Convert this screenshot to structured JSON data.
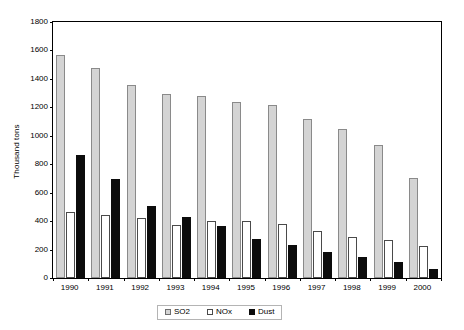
{
  "chart_data": {
    "type": "bar",
    "title": "",
    "subtitle": "",
    "xlabel": "",
    "ylabel": "Thousand tons",
    "ylim": [
      0,
      1800
    ],
    "ytick_step": 200,
    "yticks": [
      0,
      200,
      400,
      600,
      800,
      1000,
      1200,
      1400,
      1600,
      1800
    ],
    "ytick_labels": [
      "0",
      "200",
      "400",
      "600",
      "800",
      "1000",
      "1200",
      "1400",
      "1600",
      "1800"
    ],
    "grid": false,
    "legend_position": "bottom",
    "categories": [
      "1990",
      "1991",
      "1992",
      "1993",
      "1994",
      "1995",
      "1996",
      "1997",
      "1998",
      "1999",
      "2000"
    ],
    "series": [
      {
        "name": "SO2",
        "color": "#d4d4d4",
        "border_color": "#8a8a8a",
        "values": [
          1570,
          1480,
          1355,
          1295,
          1280,
          1240,
          1215,
          1120,
          1045,
          935,
          705
        ]
      },
      {
        "name": "NOx",
        "color": "#ffffff",
        "border_color": "#4a4a4a",
        "values": [
          465,
          445,
          420,
          375,
          400,
          400,
          380,
          330,
          290,
          265,
          225
        ]
      },
      {
        "name": "Dust",
        "color": "#0c0c0c",
        "border_color": "#0c0c0c",
        "values": [
          865,
          695,
          505,
          430,
          365,
          275,
          230,
          180,
          150,
          115,
          65
        ]
      }
    ]
  },
  "legend": {
    "items": [
      {
        "label": "SO2"
      },
      {
        "label": "NOx"
      },
      {
        "label": "Dust"
      }
    ]
  },
  "axis": {
    "y_title": "Thousand tons"
  }
}
